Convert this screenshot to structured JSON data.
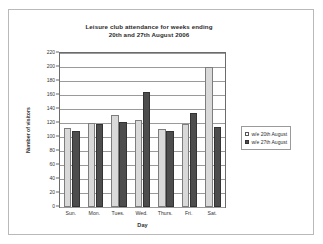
{
  "chart_data": {
    "type": "bar",
    "title": "Leisure club attendance for weeks ending 20th and 27th August 2006",
    "title_line1": "Leisure club attendance for weeks ending",
    "title_line2": "20th and 27th August 2006",
    "xlabel": "Day",
    "ylabel": "Number of visitors",
    "categories": [
      "Sun.",
      "Mon.",
      "Tues.",
      "Wed.",
      "Thurs.",
      "Fri.",
      "Sat."
    ],
    "series": [
      {
        "name": "w/e 20th August",
        "color": "#d9d9d9",
        "values": [
          113,
          120,
          132,
          125,
          111,
          118,
          200
        ]
      },
      {
        "name": "w/e 27th August",
        "color": "#4d4d4d",
        "values": [
          108,
          119,
          122,
          165,
          108,
          134,
          114
        ]
      }
    ],
    "ylim": [
      0,
      220
    ],
    "ytick_step": 20,
    "yticks": [
      0,
      20,
      40,
      60,
      80,
      100,
      120,
      140,
      160,
      180,
      200,
      220
    ],
    "grid": true,
    "legend_position": "right"
  }
}
